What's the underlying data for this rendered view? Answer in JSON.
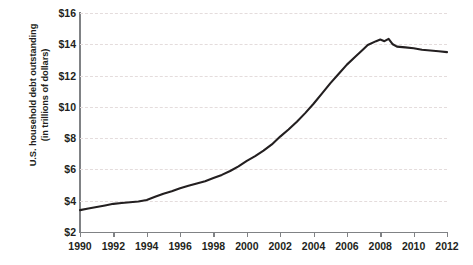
{
  "chart_data": {
    "type": "line",
    "title": "",
    "subtitle": "",
    "xlabel": "",
    "ylabel": "U.S. household debt outstanding (in trillions of dollars)",
    "ylabel_lines": [
      "U.S. household debt outstanding",
      "(in trillions of dollars)"
    ],
    "grid": "horizontal-dashed",
    "legend": "none",
    "line_color": "#231f20",
    "grid_color": "#e4dcdc",
    "axis_color": "#808285",
    "xlim": [
      1990,
      2012
    ],
    "ylim": [
      2,
      16
    ],
    "xticks": [
      1990,
      1992,
      1994,
      1996,
      1998,
      2000,
      2002,
      2004,
      2006,
      2008,
      2010,
      2012
    ],
    "xtick_labels": [
      "1990",
      "1992",
      "1994",
      "1996",
      "1998",
      "2000",
      "2002",
      "2004",
      "2006",
      "2008",
      "2010",
      "2012"
    ],
    "yticks": [
      2,
      4,
      6,
      8,
      10,
      12,
      14,
      16
    ],
    "ytick_labels": [
      "$2",
      "$4",
      "$6",
      "$8",
      "$10",
      "$12",
      "$14",
      "$16"
    ],
    "series": [
      {
        "name": "U.S. household debt outstanding",
        "units": "trillions of dollars",
        "x": [
          1990,
          1990.5,
          1991,
          1991.5,
          1992,
          1992.5,
          1993,
          1993.5,
          1994,
          1994.5,
          1995,
          1995.5,
          1996,
          1996.5,
          1997,
          1997.5,
          1998,
          1998.5,
          1999,
          1999.5,
          2000,
          2000.5,
          2001,
          2001.5,
          2002,
          2002.5,
          2003,
          2003.5,
          2004,
          2004.5,
          2005,
          2005.5,
          2006,
          2006.5,
          2007,
          2007.25,
          2007.75,
          2008,
          2008.25,
          2008.5,
          2008.75,
          2009,
          2009.5,
          2010,
          2010.5,
          2011,
          2011.5,
          2012
        ],
        "values": [
          3.4,
          3.5,
          3.6,
          3.7,
          3.8,
          3.85,
          3.9,
          3.95,
          4.05,
          4.25,
          4.45,
          4.6,
          4.8,
          4.95,
          5.1,
          5.25,
          5.45,
          5.65,
          5.9,
          6.2,
          6.55,
          6.85,
          7.2,
          7.6,
          8.1,
          8.55,
          9.05,
          9.6,
          10.2,
          10.85,
          11.5,
          12.1,
          12.7,
          13.2,
          13.7,
          13.95,
          14.2,
          14.3,
          14.2,
          14.35,
          14.0,
          13.85,
          13.8,
          13.75,
          13.65,
          13.6,
          13.55,
          13.5
        ]
      }
    ],
    "annotations": []
  }
}
